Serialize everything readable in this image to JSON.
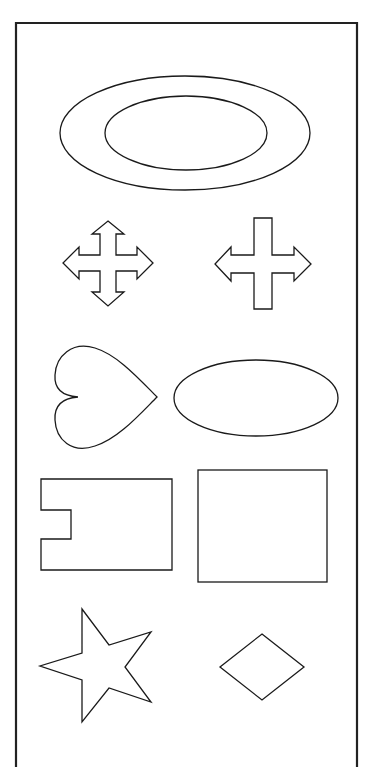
{
  "title": "Shapes worksheet",
  "colors": {
    "background": "#ffffff",
    "stroke": "#1a1a1a",
    "frame": "#222222"
  },
  "frame": {
    "label": "Shapes panel",
    "edges": [
      "top",
      "left",
      "right"
    ]
  },
  "shapes": [
    {
      "id": "ring-outer-ellipse",
      "label": "Large outer ellipse (ring)"
    },
    {
      "id": "ring-inner-ellipse",
      "label": "Inner ellipse (ring)"
    },
    {
      "id": "four-way-arrow",
      "label": "Four-way arrow"
    },
    {
      "id": "left-right-arrow-cross",
      "label": "Left-right arrow cross"
    },
    {
      "id": "heart",
      "label": "Heart (pointing right)"
    },
    {
      "id": "ellipse",
      "label": "Ellipse"
    },
    {
      "id": "notched-rectangle",
      "label": "Notched rectangle"
    },
    {
      "id": "square",
      "label": "Square"
    },
    {
      "id": "star",
      "label": "Five-pointed star"
    },
    {
      "id": "diamond",
      "label": "Diamond"
    }
  ]
}
